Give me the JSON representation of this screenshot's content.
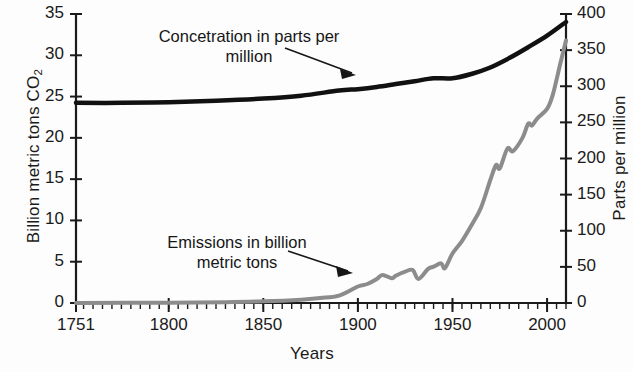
{
  "chart_data": {
    "type": "line",
    "title": "",
    "xlabel": "Years",
    "ylabel": "Billion metric tons CO2",
    "ylabel_right": "Parts per million",
    "xlim": [
      1751,
      2010
    ],
    "ylim": [
      0,
      35
    ],
    "ylim_right": [
      0,
      400
    ],
    "grid": false,
    "legend_position": "inline-annotations",
    "x_ticks": [
      1751,
      1800,
      1850,
      1900,
      1950,
      2000
    ],
    "x_tick_labels": [
      "1751",
      "1800",
      "1850",
      "1900",
      "1950",
      "2000"
    ],
    "x_minor_tick_step": 5,
    "y_ticks_left": [
      0,
      5,
      10,
      15,
      20,
      25,
      30,
      35
    ],
    "y_tick_labels_left": [
      "0",
      "5",
      "10",
      "15",
      "20",
      "25",
      "30",
      "35"
    ],
    "y_ticks_right": [
      0,
      50,
      100,
      150,
      200,
      250,
      300,
      350,
      400
    ],
    "y_tick_labels_right": [
      "0",
      "50",
      "100",
      "150",
      "200",
      "250",
      "300",
      "350",
      "400"
    ],
    "series": [
      {
        "name": "Concetration in parts per million",
        "axis": "right",
        "color": "#111111",
        "line_width": 4.5,
        "annotation": "Concetration in parts per\nmillion",
        "x": [
          1751,
          1775,
          1800,
          1825,
          1850,
          1870,
          1890,
          1900,
          1910,
          1920,
          1930,
          1940,
          1950,
          1960,
          1970,
          1980,
          1990,
          2000,
          2010
        ],
        "values": [
          277,
          277,
          278,
          280,
          283,
          287,
          294,
          296,
          299,
          303,
          307,
          311,
          311,
          317,
          326,
          339,
          354,
          370,
          389
        ]
      },
      {
        "name": "Emissions in billion metric tons",
        "axis": "left",
        "color": "#8c8c8c",
        "line_width": 4.0,
        "annotation": "Emissions in billion\nmetric tons",
        "x": [
          1751,
          1800,
          1830,
          1850,
          1870,
          1880,
          1890,
          1900,
          1905,
          1910,
          1913,
          1918,
          1920,
          1925,
          1929,
          1932,
          1937,
          1940,
          1944,
          1946,
          1950,
          1955,
          1960,
          1965,
          1970,
          1973,
          1975,
          1979,
          1982,
          1987,
          1990,
          1992,
          1995,
          2000,
          2003,
          2007,
          2010
        ],
        "values": [
          0.01,
          0.03,
          0.1,
          0.2,
          0.4,
          0.6,
          0.9,
          2.0,
          2.3,
          2.9,
          3.4,
          3.0,
          3.3,
          3.8,
          4.0,
          2.9,
          4.1,
          4.4,
          4.8,
          4.2,
          6.0,
          7.5,
          9.4,
          11.5,
          14.9,
          16.7,
          16.3,
          18.7,
          18.4,
          20.0,
          21.7,
          21.5,
          22.4,
          23.5,
          25.2,
          29.0,
          31.8
        ]
      }
    ]
  },
  "axes": {
    "left_title": "Billion metric tons CO",
    "left_title_sub": "2",
    "right_title": "Parts per million",
    "x_title": "Years"
  },
  "annotations": {
    "concentration": "Concetration in parts per\nmillion",
    "emissions": "Emissions in billion\nmetric tons"
  },
  "colors": {
    "concentration_line": "#111111",
    "emissions_line": "#8c8c8c",
    "axis": "#1a1a1a",
    "background": "#fdfdfd"
  }
}
